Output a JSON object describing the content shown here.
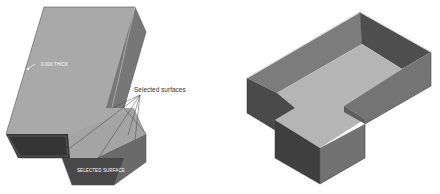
{
  "figures": {
    "left": {
      "description": "T-shaped solid block before shell operation",
      "labels": {
        "thickness_tag": "0.000 THICK",
        "callout": "Selected surfaces",
        "bottom_tag": "SELECTED SURFACE"
      }
    },
    "right": {
      "description": "Resulting shelled T-shaped part with open top"
    }
  },
  "colors": {
    "top_face": "#a8a8a8",
    "right_face": "#6e6e6e",
    "front_face": "#3c3c3c",
    "edge": "#e8e8e8",
    "inner_floor": "#b4b4b4",
    "inner_wall_dark": "#505050",
    "inner_wall_mid": "#7a7a7a"
  }
}
